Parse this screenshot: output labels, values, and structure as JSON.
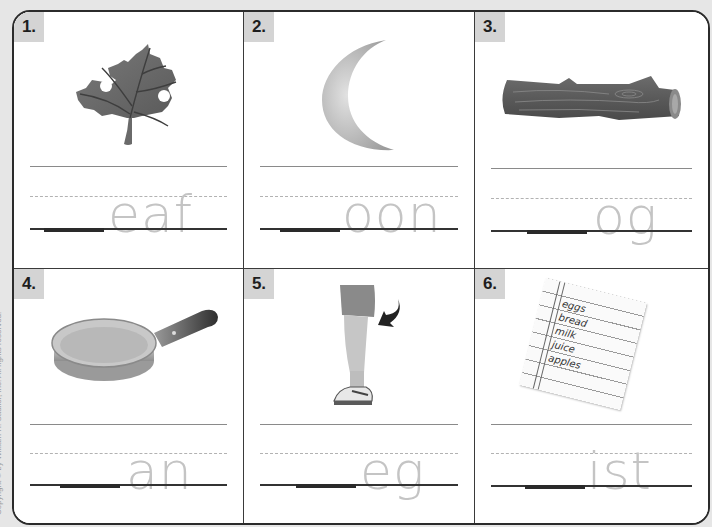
{
  "copyright": "Copyright © by William H. Sadlier, Inc. All rights reserved.",
  "colors": {
    "sheet_bg": "#ffffff",
    "page_bg": "#e6e6e6",
    "label_bg": "#d4d4d4",
    "trace_letters": "#c4c4c4",
    "border": "#2b2b2b"
  },
  "items": [
    {
      "number": "1.",
      "picture": "leaf",
      "trace": "eaf",
      "answer_blank": ""
    },
    {
      "number": "2.",
      "picture": "moon",
      "trace": "oon",
      "answer_blank": ""
    },
    {
      "number": "3.",
      "picture": "log",
      "trace": "og",
      "answer_blank": ""
    },
    {
      "number": "4.",
      "picture": "pan",
      "trace": "an",
      "answer_blank": ""
    },
    {
      "number": "5.",
      "picture": "leg",
      "trace": "eg",
      "answer_blank": ""
    },
    {
      "number": "6.",
      "picture": "list",
      "trace": "ist",
      "answer_blank": "",
      "list_items": [
        "eggs",
        "bread",
        "milk",
        "juice",
        "apples"
      ]
    }
  ]
}
